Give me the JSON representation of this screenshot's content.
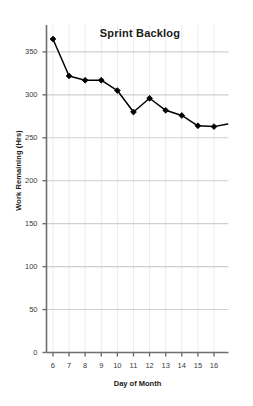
{
  "chart_data": {
    "type": "line",
    "title": "Sprint Backlog",
    "xlabel": "Day of Month",
    "ylabel": "Work Remaining (Hrs)",
    "x": [
      6,
      7,
      8,
      9,
      10,
      11,
      12,
      13,
      14,
      15,
      16
    ],
    "values": [
      365,
      322,
      317,
      317,
      305,
      280,
      296,
      282,
      276,
      264,
      263
    ],
    "series": [
      {
        "name": "Work Remaining (Hrs)",
        "values": [
          365,
          322,
          317,
          317,
          305,
          280,
          296,
          282,
          276,
          264,
          263
        ]
      }
    ],
    "xtick_labels": [
      "6",
      "7",
      "8",
      "9",
      "10",
      "11",
      "12",
      "13",
      "14",
      "15",
      "16"
    ],
    "ytick_labels": [
      "0",
      "50",
      "100",
      "150",
      "200",
      "250",
      "300",
      "350"
    ],
    "yticks": [
      0,
      50,
      100,
      150,
      200,
      250,
      300,
      350
    ],
    "ylim": [
      0,
      372
    ],
    "xlim": [
      5.6,
      16.9
    ],
    "grid": {
      "horizontal": true,
      "vertical": true,
      "horizontal_color": "#cfcfcf",
      "vertical_color": "#ececec"
    },
    "legend": null,
    "marker": "diamond",
    "marker_color": "#000000",
    "line_color": "#000000",
    "trailing_segment_end": {
      "x": 16.85,
      "y": 266
    }
  },
  "style": {
    "background": "#ffffff",
    "axis_color": "#6e6e6e",
    "text_color": "#1a1a1a",
    "tick_text_color": "#3a3a3a"
  }
}
